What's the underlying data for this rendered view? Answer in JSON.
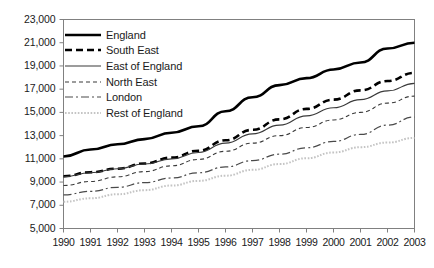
{
  "chart_data": {
    "type": "line",
    "title": "",
    "subtitle": "",
    "xlabel": "",
    "ylabel": "",
    "grid": false,
    "legend_position": "top-left",
    "x": [
      1990,
      1991,
      1992,
      1993,
      1994,
      1995,
      1996,
      1997,
      1998,
      1999,
      2000,
      2001,
      2002,
      2003
    ],
    "categories": [
      "1990",
      "1991",
      "1992",
      "1993",
      "1994",
      "1995",
      "1996",
      "1997",
      "1998",
      "1999",
      "2000",
      "2001",
      "2002",
      "2003"
    ],
    "xlim": [
      1990,
      2003
    ],
    "ylim": [
      5000,
      23000
    ],
    "yticks": [
      5000,
      7000,
      9000,
      11000,
      13000,
      15000,
      17000,
      19000,
      21000,
      23000
    ],
    "ytick_labels": [
      "5,000",
      "7,000",
      "9,000",
      "11,000",
      "13,000",
      "15,000",
      "17,000",
      "19,000",
      "21,000",
      "23,000"
    ],
    "series": [
      {
        "name": "England",
        "style": "solid-thick",
        "color": "#000000",
        "width": 2.6,
        "dash": "",
        "values": [
          11200,
          11800,
          12250,
          12700,
          13250,
          13800,
          15100,
          16300,
          17350,
          17950,
          18700,
          19300,
          20500,
          21000
        ]
      },
      {
        "name": "South East",
        "style": "dashed-thick",
        "color": "#000000",
        "width": 2.6,
        "dash": "7,4",
        "values": [
          9500,
          9850,
          10150,
          10600,
          11100,
          11700,
          12600,
          13500,
          14400,
          15300,
          16100,
          16900,
          17700,
          18400
        ]
      },
      {
        "name": "East of England",
        "style": "solid-thin",
        "color": "#3a3a3a",
        "width": 1.1,
        "dash": "",
        "values": [
          9450,
          9800,
          10150,
          10550,
          11000,
          11550,
          12350,
          13150,
          13900,
          14700,
          15400,
          16100,
          16850,
          17500
        ]
      },
      {
        "name": "North East",
        "style": "dashed-thin",
        "color": "#3a3a3a",
        "width": 1.1,
        "dash": "4,3",
        "values": [
          8700,
          9050,
          9450,
          9900,
          10400,
          10950,
          11650,
          12350,
          13000,
          13700,
          14350,
          15000,
          15800,
          16400
        ]
      },
      {
        "name": "London",
        "style": "dash-dot-thin",
        "color": "#4a4a4a",
        "width": 1.2,
        "dash": "8,3,2,3",
        "values": [
          7900,
          8200,
          8550,
          8950,
          9350,
          9800,
          10300,
          10850,
          11400,
          11950,
          12500,
          13100,
          13900,
          14600
        ]
      },
      {
        "name": "Rest of England",
        "style": "dotted-light",
        "color": "#c4c4c4",
        "width": 2.0,
        "dash": "1.6,1.6",
        "values": [
          7300,
          7600,
          7950,
          8300,
          8700,
          9100,
          9550,
          10050,
          10550,
          11050,
          11550,
          12000,
          12400,
          12800
        ]
      }
    ]
  },
  "legend": {
    "items": [
      {
        "label": "England"
      },
      {
        "label": "South East"
      },
      {
        "label": "East of England"
      },
      {
        "label": "North East"
      },
      {
        "label": "London"
      },
      {
        "label": "Rest of England"
      }
    ]
  },
  "axes": {
    "frame_color": "#808080",
    "tick_color": "#808080",
    "text_color": "#1a1a1a"
  }
}
